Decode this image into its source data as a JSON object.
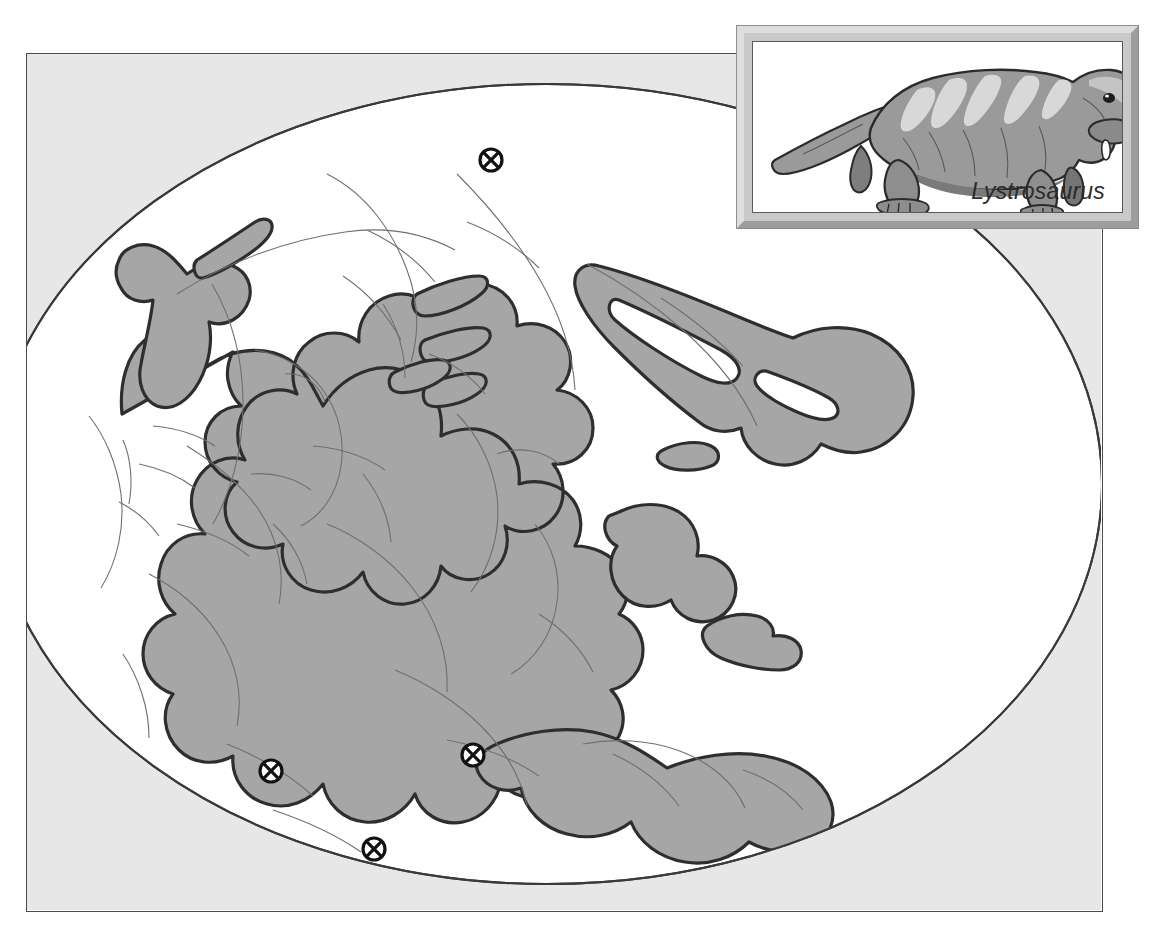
{
  "figure": {
    "kind": "paleogeographic-map",
    "projection": "elliptical (Mollweide-like) world projection"
  },
  "map": {
    "frame": {
      "x": 26,
      "y": 53,
      "width": 1077,
      "height": 859
    },
    "ellipse": {
      "cx": 520,
      "cy": 430,
      "rx": 555,
      "ry": 400
    },
    "colors": {
      "land_fill": "#a6a6a6",
      "land_outline": "#333333",
      "ocean_fill": "#ffffff",
      "outside_ellipse_fill": "#e7e7e7",
      "modern_coastline": "#6f6f6f",
      "frame_border": "#4a4a4a",
      "marker_ring": "#1a1a1a",
      "marker_fill": "#ffffff"
    },
    "fossil_markers": {
      "symbol_name": "crossed-circle-icon",
      "symbol_description": "circle with an X through it marking a fossil locality",
      "count": 4,
      "points": [
        {
          "id": "marker-north",
          "label": "fossil locality — northern landmass",
          "x": 490,
          "y": 158
        },
        {
          "id": "marker-south-america",
          "label": "fossil locality — southern landmass west",
          "x": 270,
          "y": 769
        },
        {
          "id": "marker-india",
          "label": "fossil locality — southern landmass east",
          "x": 472,
          "y": 753
        },
        {
          "id": "marker-antarctica",
          "label": "fossil locality — far southern landmass",
          "x": 373,
          "y": 847
        }
      ]
    }
  },
  "inset": {
    "caption": "Lystrosaurus",
    "illustration_name": "lystrosaurus-illustration",
    "illustration_description": "side view of a stocky four-legged dicynodont therapsid with a tusked beaked head, striped back and long tapering tail, facing right",
    "frame": {
      "x": 737,
      "y": 26,
      "width": 401,
      "height": 202
    },
    "colors": {
      "bevel_light": "#dedede",
      "bevel_dark": "#9d9d9d",
      "panel_bg": "#ffffff",
      "panel_border": "#5a5a5a",
      "body_mid": "#8e8e8e",
      "body_dark": "#6a6a6a",
      "body_light": "#cfcfcf",
      "outline": "#2b2b2b",
      "caption_color": "#2b2b2b"
    }
  }
}
